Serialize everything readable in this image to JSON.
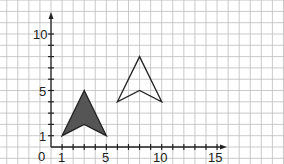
{
  "diagram": {
    "type": "coordinate-grid-transformation",
    "axes": {
      "origin_label": "0",
      "x_tick_labels": [
        "1",
        "5",
        "10",
        "15"
      ],
      "y_tick_labels": [
        "1",
        "5",
        "10"
      ],
      "x_range": [
        0,
        15
      ],
      "y_range": [
        0,
        10
      ]
    },
    "shapes": [
      {
        "name": "filled-arrowhead",
        "style": "filled",
        "fill": "#555555",
        "stroke": "#222222",
        "points": [
          [
            1,
            1
          ],
          [
            3,
            5
          ],
          [
            5,
            1
          ],
          [
            3,
            2
          ]
        ]
      },
      {
        "name": "outlined-arrowhead",
        "style": "outline",
        "fill": "none",
        "stroke": "#222222",
        "points": [
          [
            6,
            4
          ],
          [
            8,
            8
          ],
          [
            10,
            4
          ],
          [
            8,
            5
          ]
        ]
      }
    ],
    "colors": {
      "grid": "#bdbdbd",
      "axis": "#222222",
      "background": "#ffffff"
    }
  }
}
